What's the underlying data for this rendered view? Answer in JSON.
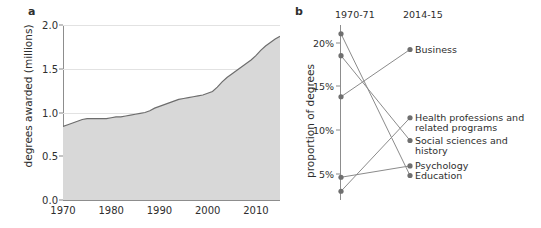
{
  "figure": {
    "panel_a_letter": "a",
    "panel_b_letter": "b"
  },
  "chart_data": [
    {
      "id": "panel-a",
      "type": "area",
      "title": "",
      "xlabel": "",
      "ylabel": "degrees awarded (millions)",
      "xlim": [
        1970,
        2015
      ],
      "ylim": [
        0.0,
        2.0
      ],
      "grid": true,
      "legend": "none",
      "xticks": [
        "1970",
        "1980",
        "1990",
        "2000",
        "2010"
      ],
      "xtick_values": [
        1970,
        1980,
        1990,
        2000,
        2010
      ],
      "yticks": [
        "0.0",
        "0.5",
        "1.0",
        "1.5",
        "2.0"
      ],
      "ytick_values": [
        0.0,
        0.5,
        1.0,
        1.5,
        2.0
      ],
      "x": [
        1970,
        1971,
        1972,
        1973,
        1974,
        1975,
        1976,
        1977,
        1978,
        1979,
        1980,
        1981,
        1982,
        1983,
        1984,
        1985,
        1986,
        1987,
        1988,
        1989,
        1990,
        1991,
        1992,
        1993,
        1994,
        1995,
        1996,
        1997,
        1998,
        1999,
        2000,
        2001,
        2002,
        2003,
        2004,
        2005,
        2006,
        2007,
        2008,
        2009,
        2010,
        2011,
        2012,
        2013,
        2014,
        2015
      ],
      "values": [
        0.84,
        0.86,
        0.88,
        0.9,
        0.92,
        0.93,
        0.93,
        0.93,
        0.93,
        0.93,
        0.94,
        0.95,
        0.95,
        0.96,
        0.97,
        0.98,
        0.99,
        1.0,
        1.02,
        1.05,
        1.07,
        1.09,
        1.11,
        1.13,
        1.15,
        1.16,
        1.17,
        1.18,
        1.19,
        1.2,
        1.22,
        1.24,
        1.29,
        1.35,
        1.4,
        1.44,
        1.48,
        1.52,
        1.56,
        1.6,
        1.65,
        1.71,
        1.76,
        1.8,
        1.84,
        1.87
      ],
      "fill_color": "#d8d8d8",
      "line_color": "#6d6d6d"
    },
    {
      "id": "panel-b",
      "type": "line",
      "subtype": "slopegraph",
      "title": "",
      "ylabel": "proportion of degrees",
      "categories": [
        "1970-71",
        "2014-15"
      ],
      "ylim": [
        2.0,
        22.0
      ],
      "yticks": [
        "5%",
        "10%",
        "15%",
        "20%"
      ],
      "ytick_values": [
        5,
        10,
        15,
        20
      ],
      "grid": false,
      "legend": "right",
      "series": [
        {
          "name": "Education",
          "values": [
            21.0,
            4.8
          ],
          "label_lines": [
            "Education"
          ]
        },
        {
          "name": "Social sciences and history",
          "values": [
            18.5,
            8.8
          ],
          "label_lines": [
            "Social sciences and",
            "history"
          ]
        },
        {
          "name": "Psychology",
          "values": [
            4.6,
            5.9
          ],
          "label_lines": [
            "Psychology"
          ]
        },
        {
          "name": "Business",
          "values": [
            13.8,
            19.2
          ],
          "label_lines": [
            "Business"
          ]
        },
        {
          "name": "Health professions and related programs",
          "values": [
            3.0,
            11.4
          ],
          "label_lines": [
            "Health professions and",
            "related programs"
          ]
        }
      ],
      "dot_color": "#6f6f6f",
      "line_color": "#8b8b8b"
    }
  ]
}
